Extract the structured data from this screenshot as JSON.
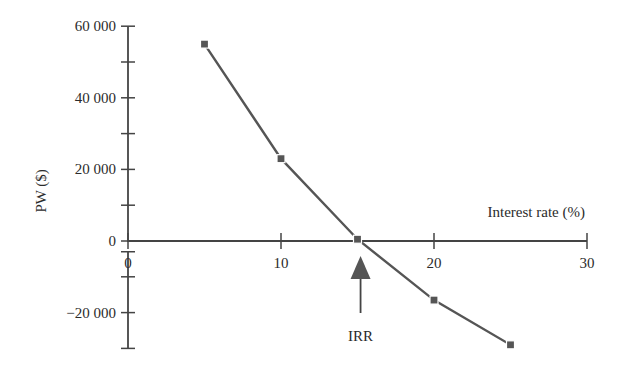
{
  "chart_data": {
    "type": "line",
    "title": "",
    "xlabel": "Interest rate (%)",
    "ylabel": "PW ($)",
    "xlim": [
      0,
      30
    ],
    "ylim": [
      -30000,
      60000
    ],
    "x_ticks": [
      0,
      10,
      20,
      30
    ],
    "x_tick_labels": [
      "0",
      "10",
      "20",
      "30"
    ],
    "y_ticks": [
      60000,
      40000,
      20000,
      0,
      -20000
    ],
    "y_tick_labels": [
      "60 000",
      "40 000",
      "20 000",
      "0",
      "−20 000"
    ],
    "y_minor_ticks": [
      50000,
      30000,
      10000,
      -10000,
      -30000
    ],
    "grid": false,
    "legend": null,
    "series": [
      {
        "name": "PW",
        "marker": "square",
        "color": "#555555",
        "x": [
          5,
          10,
          15,
          20,
          25
        ],
        "y": [
          55000,
          23000,
          500,
          -16500,
          -29000
        ]
      }
    ],
    "annotations": [
      {
        "text": "IRR",
        "type": "arrow",
        "x": 15.2,
        "y": 0,
        "pointing": "up"
      }
    ]
  },
  "colors": {
    "axis": "#444444",
    "line": "#555555",
    "marker": "#555555",
    "text": "#2b2b2b"
  }
}
